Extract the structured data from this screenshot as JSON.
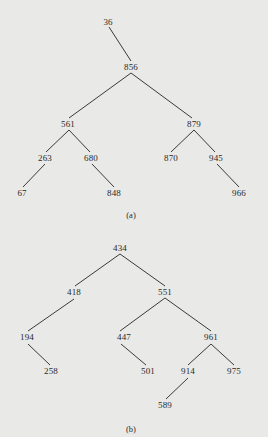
{
  "diagrams": [
    {
      "id": "a",
      "caption": "(a)",
      "caption_pos": [
        131,
        215
      ],
      "nodes": [
        {
          "key": "36",
          "label": "36",
          "x": 108,
          "y": 22
        },
        {
          "key": "856",
          "label": "856",
          "x": 131,
          "y": 67
        },
        {
          "key": "561",
          "label": "561",
          "x": 68,
          "y": 124
        },
        {
          "key": "879",
          "label": "879",
          "x": 194,
          "y": 124
        },
        {
          "key": "263",
          "label": "263",
          "x": 45,
          "y": 158
        },
        {
          "key": "680",
          "label": "680",
          "x": 91,
          "y": 158
        },
        {
          "key": "870",
          "label": "870",
          "x": 171,
          "y": 158
        },
        {
          "key": "945",
          "label": "945",
          "x": 216,
          "y": 158
        },
        {
          "key": "67",
          "label": "67",
          "x": 22,
          "y": 193
        },
        {
          "key": "848",
          "label": "848",
          "x": 114,
          "y": 193
        },
        {
          "key": "966",
          "label": "966",
          "x": 239,
          "y": 193
        }
      ],
      "edges": [
        {
          "from": "36",
          "to": "856",
          "x1": 109,
          "y1": 27,
          "x2": 131,
          "y2": 61
        },
        {
          "from": "856",
          "to": "561",
          "x1": 131,
          "y1": 73,
          "x2": 69,
          "y2": 118
        },
        {
          "from": "856",
          "to": "879",
          "x1": 131,
          "y1": 73,
          "x2": 192,
          "y2": 118
        },
        {
          "from": "561",
          "to": "263",
          "x1": 69,
          "y1": 130,
          "x2": 46,
          "y2": 152
        },
        {
          "from": "561",
          "to": "680",
          "x1": 69,
          "y1": 130,
          "x2": 90,
          "y2": 152
        },
        {
          "from": "879",
          "to": "870",
          "x1": 194,
          "y1": 130,
          "x2": 171,
          "y2": 152
        },
        {
          "from": "879",
          "to": "945",
          "x1": 194,
          "y1": 130,
          "x2": 215,
          "y2": 152
        },
        {
          "from": "263",
          "to": "67",
          "x1": 45,
          "y1": 164,
          "x2": 23,
          "y2": 187
        },
        {
          "from": "680",
          "to": "848",
          "x1": 92,
          "y1": 164,
          "x2": 114,
          "y2": 187
        },
        {
          "from": "945",
          "to": "966",
          "x1": 217,
          "y1": 164,
          "x2": 239,
          "y2": 187
        }
      ]
    },
    {
      "id": "b",
      "caption": "(b)",
      "caption_pos": [
        131,
        429
      ],
      "nodes": [
        {
          "key": "434",
          "label": "434",
          "x": 120,
          "y": 248
        },
        {
          "key": "418",
          "label": "418",
          "x": 74,
          "y": 292
        },
        {
          "key": "551",
          "label": "551",
          "x": 165,
          "y": 292
        },
        {
          "key": "194",
          "label": "194",
          "x": 27,
          "y": 337
        },
        {
          "key": "447",
          "label": "447",
          "x": 124,
          "y": 337
        },
        {
          "key": "961",
          "label": "961",
          "x": 211,
          "y": 337
        },
        {
          "key": "258",
          "label": "258",
          "x": 51,
          "y": 371
        },
        {
          "key": "501",
          "label": "501",
          "x": 148,
          "y": 371
        },
        {
          "key": "914",
          "label": "914",
          "x": 188,
          "y": 371
        },
        {
          "key": "975",
          "label": "975",
          "x": 234,
          "y": 371
        },
        {
          "key": "589",
          "label": "589",
          "x": 165,
          "y": 405
        }
      ],
      "edges": [
        {
          "from": "434",
          "to": "418",
          "x1": 120,
          "y1": 254,
          "x2": 75,
          "y2": 286
        },
        {
          "from": "434",
          "to": "551",
          "x1": 120,
          "y1": 254,
          "x2": 165,
          "y2": 286
        },
        {
          "from": "418",
          "to": "194",
          "x1": 74,
          "y1": 299,
          "x2": 28,
          "y2": 331
        },
        {
          "from": "551",
          "to": "447",
          "x1": 165,
          "y1": 298,
          "x2": 120,
          "y2": 331
        },
        {
          "from": "551",
          "to": "961",
          "x1": 165,
          "y1": 298,
          "x2": 211,
          "y2": 331
        },
        {
          "from": "194",
          "to": "258",
          "x1": 28,
          "y1": 344,
          "x2": 50,
          "y2": 365
        },
        {
          "from": "447",
          "to": "501",
          "x1": 121,
          "y1": 344,
          "x2": 146,
          "y2": 365
        },
        {
          "from": "961",
          "to": "914",
          "x1": 211,
          "y1": 344,
          "x2": 188,
          "y2": 365
        },
        {
          "from": "961",
          "to": "975",
          "x1": 211,
          "y1": 344,
          "x2": 234,
          "y2": 365
        },
        {
          "from": "914",
          "to": "589",
          "x1": 188,
          "y1": 378,
          "x2": 166,
          "y2": 399
        }
      ]
    }
  ],
  "colors": {
    "background": "#e9e9e7",
    "ink": "#2a2a2a",
    "edge": "#3a3a3a"
  }
}
